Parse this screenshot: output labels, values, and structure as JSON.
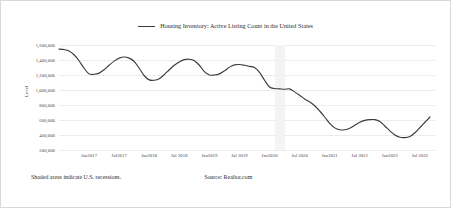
{
  "chart_data": {
    "type": "line",
    "title": "",
    "legend": [
      "Housing Inventory: Active Listing Count in the United States"
    ],
    "legend_position": "top-center",
    "xlabel": "",
    "ylabel": "Level",
    "ylim": [
      200000,
      1600000
    ],
    "ytick_values": [
      1600000,
      1400000,
      1200000,
      1000000,
      800000,
      600000,
      400000,
      200000
    ],
    "ytick_labels": [
      "1,600,000",
      "1,400,000",
      "1,200,000",
      "1,000,000",
      "800,000",
      "600,000",
      "400,000",
      "200,000"
    ],
    "xtick_labels": [
      "Jan2017",
      "Jul2017",
      "Jan2018",
      "Jul 2018",
      "Jan2019",
      "Jul 2019",
      "Jan2020",
      "Jul 2020",
      "Jan2021",
      "Jul 2021",
      "Jan2022",
      "Jul 2022"
    ],
    "xtick_x": [
      "2017-01",
      "2017-07",
      "2018-01",
      "2018-07",
      "2019-01",
      "2019-07",
      "2020-01",
      "2020-07",
      "2021-01",
      "2021-07",
      "2022-01",
      "2022-07"
    ],
    "xlim": [
      "2016-07",
      "2022-10"
    ],
    "grid": true,
    "grid_axis": "y",
    "line_color": "#3b3b3b",
    "shaded_regions": [
      {
        "label": "U.S. recession",
        "start": "2020-02",
        "end": "2020-04",
        "color": "#f4f4f4"
      }
    ],
    "x": [
      "2016-07",
      "2016-08",
      "2016-09",
      "2016-10",
      "2016-11",
      "2016-12",
      "2017-01",
      "2017-02",
      "2017-03",
      "2017-04",
      "2017-05",
      "2017-06",
      "2017-07",
      "2017-08",
      "2017-09",
      "2017-10",
      "2017-11",
      "2017-12",
      "2018-01",
      "2018-02",
      "2018-03",
      "2018-04",
      "2018-05",
      "2018-06",
      "2018-07",
      "2018-08",
      "2018-09",
      "2018-10",
      "2018-11",
      "2018-12",
      "2019-01",
      "2019-02",
      "2019-03",
      "2019-04",
      "2019-05",
      "2019-06",
      "2019-07",
      "2019-08",
      "2019-09",
      "2019-10",
      "2019-11",
      "2019-12",
      "2020-01",
      "2020-02",
      "2020-03",
      "2020-04",
      "2020-05",
      "2020-06",
      "2020-07",
      "2020-08",
      "2020-09",
      "2020-10",
      "2020-11",
      "2020-12",
      "2021-01",
      "2021-02",
      "2021-03",
      "2021-04",
      "2021-05",
      "2021-06",
      "2021-07",
      "2021-08",
      "2021-09",
      "2021-10",
      "2021-11",
      "2021-12",
      "2022-01",
      "2022-02",
      "2022-03",
      "2022-04",
      "2022-05",
      "2022-06",
      "2022-07",
      "2022-08",
      "2022-09"
    ],
    "series": [
      {
        "name": "Housing Inventory: Active Listing Count in the United States",
        "values": [
          1545000,
          1540000,
          1520000,
          1470000,
          1390000,
          1290000,
          1215000,
          1210000,
          1225000,
          1270000,
          1330000,
          1385000,
          1425000,
          1440000,
          1425000,
          1380000,
          1290000,
          1190000,
          1135000,
          1130000,
          1150000,
          1205000,
          1270000,
          1330000,
          1375000,
          1405000,
          1410000,
          1390000,
          1330000,
          1245000,
          1200000,
          1200000,
          1215000,
          1255000,
          1305000,
          1335000,
          1340000,
          1330000,
          1315000,
          1300000,
          1235000,
          1130000,
          1040000,
          1020000,
          1015000,
          1010000,
          1015000,
          975000,
          930000,
          880000,
          840000,
          790000,
          720000,
          640000,
          555000,
          495000,
          470000,
          470000,
          490000,
          530000,
          570000,
          595000,
          605000,
          605000,
          580000,
          520000,
          455000,
          400000,
          370000,
          365000,
          380000,
          430000,
          500000,
          570000,
          640000
        ]
      }
    ]
  },
  "footer": {
    "note": "Shaded areas indicate U.S. recessions.",
    "source": "Source: Realtor.com"
  }
}
